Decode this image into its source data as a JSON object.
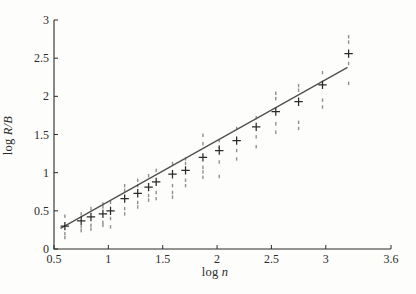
{
  "page": {
    "background": "#fdfdfb"
  },
  "chart_data": {
    "type": "scatter",
    "title": "",
    "xlabel": "log n",
    "ylabel": "log R/B",
    "xlabel_parts": {
      "prefix": "log ",
      "var": "n"
    },
    "ylabel_parts": {
      "prefix": "log ",
      "var": "R/B"
    },
    "xlim": [
      0.5,
      3.6
    ],
    "ylim": [
      0,
      3
    ],
    "grid": false,
    "legend": "none",
    "x_ticks": [
      {
        "value": 0.5,
        "label": "0.5"
      },
      {
        "value": 1,
        "label": "1"
      },
      {
        "value": 1.5,
        "label": "1.5"
      },
      {
        "value": 2,
        "label": "2"
      },
      {
        "value": 2.5,
        "label": "2.5"
      },
      {
        "value": 3,
        "label": "3"
      },
      {
        "value": 3.6,
        "label": "3.6"
      }
    ],
    "y_ticks": [
      {
        "value": 0,
        "label": "0"
      },
      {
        "value": 0.5,
        "label": "0.5"
      },
      {
        "value": 1,
        "label": "1"
      },
      {
        "value": 1.5,
        "label": "1.5"
      },
      {
        "value": 2,
        "label": "2"
      },
      {
        "value": 2.5,
        "label": "2.5"
      },
      {
        "value": 3,
        "label": "3"
      }
    ],
    "fit_line": {
      "x1": 0.56,
      "y1": 0.27,
      "x2": 3.2,
      "y2": 2.38,
      "slope_approx": 0.8
    },
    "series": [
      {
        "name": "individual samples",
        "marker": "dash-dot",
        "color": "#8f8f8f",
        "points": [
          [
            0.6,
            0.43
          ],
          [
            0.6,
            0.2
          ],
          [
            0.6,
            0.15
          ],
          [
            0.75,
            0.46
          ],
          [
            0.75,
            0.29
          ],
          [
            0.75,
            0.24
          ],
          [
            0.84,
            0.53
          ],
          [
            0.84,
            0.31
          ],
          [
            0.84,
            0.26
          ],
          [
            0.95,
            0.59
          ],
          [
            0.95,
            0.55
          ],
          [
            0.95,
            0.35
          ],
          [
            0.95,
            0.31
          ],
          [
            1.02,
            0.61
          ],
          [
            1.02,
            0.4
          ],
          [
            1.02,
            0.29
          ],
          [
            1.15,
            0.83
          ],
          [
            1.15,
            0.77
          ],
          [
            1.15,
            0.53
          ],
          [
            1.15,
            0.46
          ],
          [
            1.27,
            0.9
          ],
          [
            1.27,
            0.83
          ],
          [
            1.27,
            0.61
          ],
          [
            1.27,
            0.55
          ],
          [
            1.37,
            0.96
          ],
          [
            1.37,
            0.7
          ],
          [
            1.37,
            0.64
          ],
          [
            1.44,
            1.03
          ],
          [
            1.44,
            0.74
          ],
          [
            1.44,
            0.66
          ],
          [
            1.59,
            1.12
          ],
          [
            1.59,
            0.83
          ],
          [
            1.59,
            0.74
          ],
          [
            1.59,
            0.68
          ],
          [
            1.71,
            1.18
          ],
          [
            1.71,
            1.12
          ],
          [
            1.71,
            0.9
          ],
          [
            1.71,
            0.83
          ],
          [
            1.87,
            1.49
          ],
          [
            1.87,
            1.38
          ],
          [
            1.87,
            1.07
          ],
          [
            1.87,
            1.01
          ],
          [
            1.87,
            0.94
          ],
          [
            2.02,
            1.42
          ],
          [
            2.02,
            1.34
          ],
          [
            2.02,
            1.14
          ],
          [
            2.02,
            0.95
          ],
          [
            2.18,
            1.58
          ],
          [
            2.18,
            1.29
          ],
          [
            2.18,
            1.18
          ],
          [
            2.36,
            1.72
          ],
          [
            2.36,
            1.47
          ],
          [
            2.36,
            1.34
          ],
          [
            2.54,
            2.04
          ],
          [
            2.54,
            1.97
          ],
          [
            2.54,
            1.64
          ],
          [
            2.54,
            1.53
          ],
          [
            2.75,
            2.14
          ],
          [
            2.75,
            2.08
          ],
          [
            2.75,
            1.66
          ],
          [
            2.75,
            1.58
          ],
          [
            2.97,
            2.31
          ],
          [
            2.97,
            1.95
          ],
          [
            2.97,
            1.86
          ],
          [
            3.21,
            2.78
          ],
          [
            3.21,
            2.71
          ],
          [
            3.21,
            2.43
          ],
          [
            3.21,
            2.17
          ]
        ]
      },
      {
        "name": "cluster means",
        "marker": "plus",
        "color": "#2a2a2a",
        "points": [
          [
            0.6,
            0.3
          ],
          [
            0.75,
            0.37
          ],
          [
            0.84,
            0.42
          ],
          [
            0.95,
            0.46
          ],
          [
            1.02,
            0.5
          ],
          [
            1.15,
            0.66
          ],
          [
            1.27,
            0.73
          ],
          [
            1.37,
            0.81
          ],
          [
            1.44,
            0.88
          ],
          [
            1.59,
            0.98
          ],
          [
            1.71,
            1.03
          ],
          [
            1.87,
            1.2
          ],
          [
            2.02,
            1.29
          ],
          [
            2.18,
            1.42
          ],
          [
            2.36,
            1.6
          ],
          [
            2.54,
            1.8
          ],
          [
            2.75,
            1.93
          ],
          [
            2.97,
            2.15
          ],
          [
            3.21,
            2.56
          ]
        ]
      }
    ],
    "colors": {
      "axis": "#2b2b2b",
      "tick_label": "#2b2b2b",
      "fit_line": "#4f4f4f"
    }
  }
}
